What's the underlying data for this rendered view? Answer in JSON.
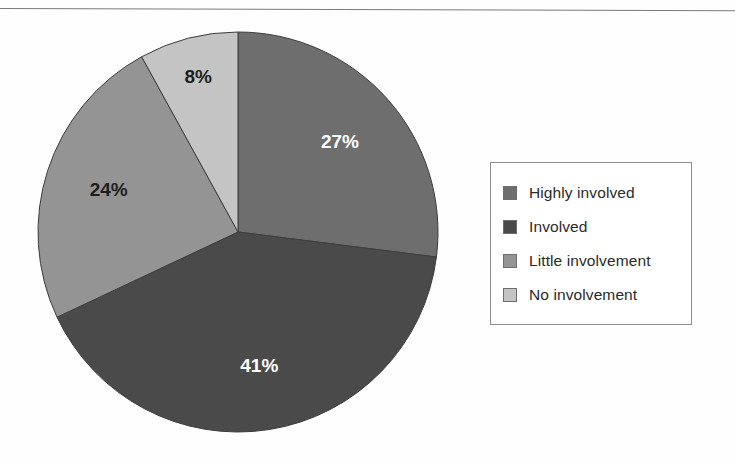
{
  "chart_data": {
    "type": "pie",
    "title": "",
    "subtitle": "",
    "xlabel": "",
    "ylabel": "",
    "legend_position": "right",
    "grid": false,
    "start_angle_deg": 0,
    "direction": "clockwise",
    "categories": [
      "Highly involved",
      "Involved",
      "Little involvement",
      "No involvement"
    ],
    "values": [
      27,
      41,
      24,
      8
    ],
    "value_unit": "%",
    "data_labels": [
      "27%",
      "41%",
      "24%",
      "8%"
    ],
    "colors": [
      "#6e6e6e",
      "#4a4a4a",
      "#949494",
      "#c4c4c4"
    ],
    "slices": [
      {
        "label": "Highly involved",
        "value": 27,
        "data_label": "27%",
        "color": "#6e6e6e",
        "label_color": "light"
      },
      {
        "label": "Involved",
        "value": 41,
        "data_label": "41%",
        "color": "#4a4a4a",
        "label_color": "light"
      },
      {
        "label": "Little involvement",
        "value": 24,
        "data_label": "24%",
        "color": "#949494",
        "label_color": "dark"
      },
      {
        "label": "No involvement",
        "value": 8,
        "data_label": "8%",
        "color": "#c4c4c4",
        "label_color": "dark"
      }
    ]
  },
  "legend": {
    "items": [
      {
        "label": "Highly involved",
        "color": "#6e6e6e"
      },
      {
        "label": "Involved",
        "color": "#4a4a4a"
      },
      {
        "label": "Little involvement",
        "color": "#949494"
      },
      {
        "label": "No involvement",
        "color": "#c4c4c4"
      }
    ]
  }
}
